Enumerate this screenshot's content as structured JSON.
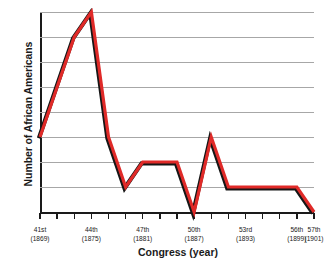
{
  "chart_data": {
    "type": "line",
    "title": "",
    "xlabel": "Congress (year)",
    "ylabel": "Number of African Americans",
    "ylim": [
      0,
      8
    ],
    "yticks": [
      "0",
      "1",
      "2",
      "3",
      "4",
      "5",
      "6",
      "7",
      "8"
    ],
    "grid": true,
    "legend": null,
    "line_color": "#e02a28",
    "shadow_color": "#161616",
    "categories": [
      "41st",
      "42nd",
      "43rd",
      "44th",
      "45th",
      "46th",
      "47th",
      "48th",
      "49th",
      "50th",
      "51st",
      "52nd",
      "53rd",
      "54th",
      "55th",
      "56th",
      "57th"
    ],
    "x_tick_labels": [
      {
        "index": 0,
        "congress": "41st",
        "year": "(1869)"
      },
      {
        "index": 3,
        "congress": "44th",
        "year": "(1875)"
      },
      {
        "index": 6,
        "congress": "47th",
        "year": "(1881)"
      },
      {
        "index": 9,
        "congress": "50th",
        "year": "(1887)"
      },
      {
        "index": 12,
        "congress": "53rd",
        "year": "(1893)"
      },
      {
        "index": 15,
        "congress": "56th",
        "year": "(1899)"
      },
      {
        "index": 16,
        "congress": "57th",
        "year": "(1901)"
      }
    ],
    "values": [
      3,
      5,
      7,
      8,
      3,
      1,
      2,
      2,
      2,
      0,
      3,
      1,
      1,
      1,
      1,
      1,
      0
    ]
  }
}
